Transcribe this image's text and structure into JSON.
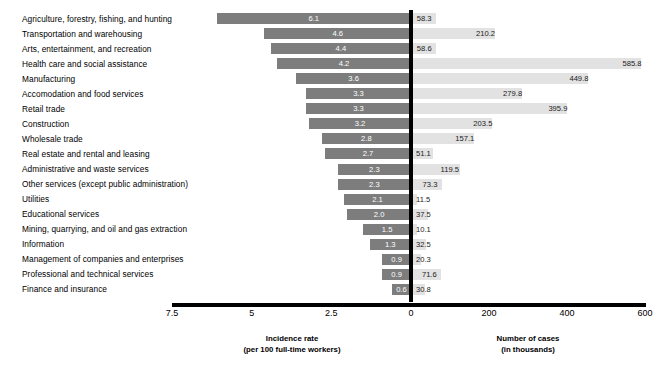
{
  "chart_data": {
    "type": "bar",
    "title": "",
    "subtitle": "",
    "orientation": "horizontal-diverging",
    "categories": [
      "Agriculture, forestry, fishing, and hunting",
      "Transportation and warehousing",
      "Arts, entertainment, and recreation",
      "Health care and social assistance",
      "Manufacturing",
      "Accomodation and food services",
      "Retail trade",
      "Construction",
      "Wholesale trade",
      "Real estate and rental and leasing",
      "Administrative and waste services",
      "Other services (except public administration)",
      "Utilities",
      "Educational services",
      "Mining, quarrying, and oil and gas extraction",
      "Information",
      "Management of companies and enterprises",
      "Professional and technical services",
      "Finance and insurance"
    ],
    "series": [
      {
        "name": "Incidence rate",
        "side": "left",
        "color": "#7d7d7d",
        "values": [
          6.1,
          4.6,
          4.4,
          4.2,
          3.6,
          3.3,
          3.3,
          3.2,
          2.8,
          2.7,
          2.3,
          2.3,
          2.1,
          2.0,
          1.5,
          1.3,
          0.9,
          0.9,
          0.6
        ],
        "labels": [
          "6.1",
          "4.6",
          "4.4",
          "4.2",
          "3.6",
          "3.3",
          "3.3",
          "3.2",
          "2.8",
          "2.7",
          "2.3",
          "2.3",
          "2.1",
          "2.0",
          "1.5",
          "1.3",
          "0.9",
          "0.9",
          "0.6"
        ],
        "axis_title_line1": "Incidence rate",
        "axis_title_line2": "(per 100 full-time workers)",
        "ticks": [
          "7.5",
          "5",
          "2.5",
          "0"
        ],
        "tick_values": [
          7.5,
          5,
          2.5,
          0
        ],
        "xlim": [
          7.5,
          0
        ]
      },
      {
        "name": "Number of cases",
        "side": "right",
        "color": "#e2e2e2",
        "values": [
          58.3,
          210.2,
          58.6,
          585.8,
          449.8,
          279.8,
          395.9,
          203.5,
          157.1,
          51.1,
          119.5,
          73.3,
          11.5,
          37.5,
          10.1,
          32.5,
          20.3,
          71.6,
          30.8
        ],
        "labels": [
          "58.3",
          "210.2",
          "58.6",
          "585.8",
          "449.8",
          "279.8",
          "395.9",
          "203.5",
          "157.1",
          "51.1",
          "119.5",
          "73.3",
          "11.5",
          "37.5",
          "10.1",
          "32.5",
          "20.3",
          "71.6",
          "30.8"
        ],
        "axis_title_line1": "Number of cases",
        "axis_title_line2": "(in thousands)",
        "ticks": [
          "0",
          "200",
          "400",
          "600"
        ],
        "tick_values": [
          0,
          200,
          400,
          600
        ],
        "xlim": [
          0,
          600
        ]
      }
    ],
    "grid": false,
    "legend": "none"
  }
}
